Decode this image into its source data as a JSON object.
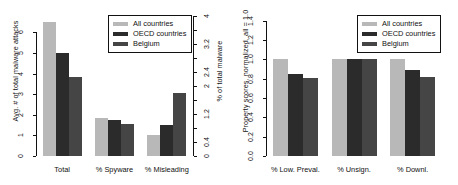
{
  "figure": {
    "background": "#ffffff",
    "panels": 2
  },
  "colors": {
    "all_countries": "#b8b8b8",
    "oecd_countries": "#2b2b2b",
    "belgium": "#454545",
    "axis": "#111111",
    "legend_border": "#111111",
    "legend_background": "#ffffff"
  },
  "legend": {
    "position": "top-right",
    "entries": [
      {
        "label": "All countries",
        "color": "#b8b8b8",
        "swatch": "legend-swatch-all-countries"
      },
      {
        "label": "OECD countries",
        "color": "#2b2b2b",
        "swatch": "legend-swatch-oecd-countries"
      },
      {
        "label": "Belgium",
        "color": "#454545",
        "swatch": "legend-swatch-belgium"
      }
    ]
  },
  "chart_data": [
    {
      "id": "left-panel",
      "type": "bar",
      "title": "",
      "xlabel": "",
      "ylabel": "Avg. # of total malware attacks",
      "y2label": "% of total malware",
      "categories": [
        "Total",
        "% Spyware",
        "% Misleading"
      ],
      "series": [
        {
          "name": "All countries",
          "color": "#b8b8b8",
          "values": [
            6.5,
            1.87,
            1.0
          ]
        },
        {
          "name": "OECD countries",
          "color": "#2b2b2b",
          "values": [
            5.0,
            1.77,
            1.53
          ]
        },
        {
          "name": "Belgium",
          "color": "#454545",
          "values": [
            3.85,
            1.57,
            3.05
          ]
        }
      ],
      "ylim": [
        0,
        6.8
      ],
      "yticks": [
        0,
        1,
        2,
        3,
        4,
        5,
        6
      ],
      "yticklabels": [
        "0",
        "1",
        "2",
        "3",
        "4",
        "5",
        "6"
      ],
      "y2lim": [
        0,
        4.0
      ],
      "y2ticks": [
        0,
        0.4,
        0.8,
        1.2,
        1.6,
        2.0,
        2.4,
        2.8,
        3.2,
        3.6,
        4.0
      ],
      "y2ticklabels": [
        "0",
        "0.4",
        "",
        "1.2",
        "",
        "2",
        "2.4",
        "",
        "3.2",
        "",
        "4"
      ],
      "grid": false,
      "legend_position": "top-right"
    },
    {
      "id": "right-panel",
      "type": "bar",
      "title": "",
      "xlabel": "",
      "ylabel": "Property scores, normalized, all = 1.0",
      "categories": [
        "% Low. Preval.",
        "% Unsign.",
        "% Downl."
      ],
      "series": [
        {
          "name": "All countries",
          "color": "#b8b8b8",
          "values": [
            1.0,
            1.0,
            1.0
          ]
        },
        {
          "name": "OECD countries",
          "color": "#2b2b2b",
          "values": [
            0.85,
            1.0,
            0.89
          ]
        },
        {
          "name": "Belgium",
          "color": "#454545",
          "values": [
            0.81,
            1.0,
            0.82
          ]
        }
      ],
      "ylim": [
        0,
        1.45
      ],
      "yticks": [
        0.0,
        0.2,
        0.4,
        0.6,
        0.8,
        1.0,
        1.2,
        1.4
      ],
      "yticklabels": [
        "0.0",
        "0.2",
        "0.4",
        "0.6",
        "0.8",
        "1.0",
        "1.2",
        "1.4"
      ],
      "grid": false,
      "legend_position": "top-right"
    }
  ]
}
